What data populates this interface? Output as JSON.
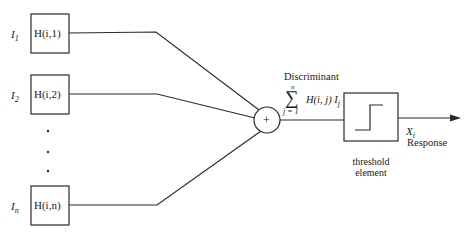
{
  "inputs": [
    {
      "label": "I",
      "sub": "1",
      "filter": "H(i,1)"
    },
    {
      "label": "I",
      "sub": "2",
      "filter": "H(i,2)"
    },
    {
      "label": "I",
      "sub": "n",
      "filter": "H(i,n)"
    }
  ],
  "ellipsis": "⋮",
  "summer": {
    "symbol": "+"
  },
  "discriminant": {
    "title": "Discriminant",
    "sigma": "∑",
    "upper": "n",
    "lower": "j = 1",
    "expr": "H(i, j) I",
    "expr_sub": "j"
  },
  "threshold": {
    "line1": "threshold",
    "line2": "element"
  },
  "output": {
    "symbol": "X",
    "sub": "i",
    "label": "Response"
  },
  "colors": {
    "stroke": "#2a2a2a",
    "background": "#ffffff"
  }
}
